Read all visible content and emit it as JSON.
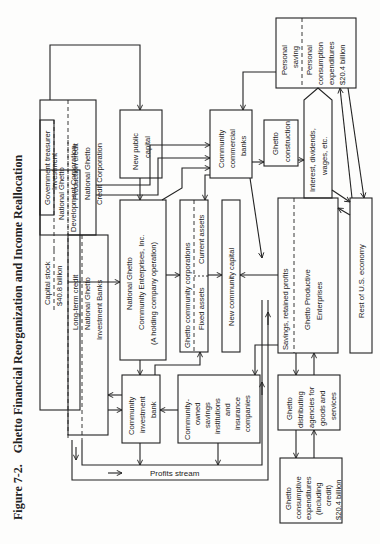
{
  "figure": {
    "number": "Figure 7-2.",
    "title": "Ghetto Financial Reorganization and Income Reallocation"
  },
  "nodes": {
    "gov_treasurer": "Government treasurer",
    "ngdc": [
      "National Ghetto",
      "Development Corporation"
    ],
    "capital_stock": [
      "Capital stock",
      "$40.8 billion"
    ],
    "investment": "Investment",
    "production_credit": "Production credit",
    "ngcc": [
      "National Ghetto",
      "Credit Corporation"
    ],
    "long_term_credit": "Long-term credit",
    "ngib": [
      "National Ghetto",
      "Investment Banks"
    ],
    "new_public_capital": [
      "New public",
      "capital"
    ],
    "ngce": [
      "National Ghetto",
      "Community Enterprises, Inc.",
      "(A holding company operation)"
    ],
    "community_investment_bank": [
      "Community",
      "investment",
      "bank"
    ],
    "community_savings": [
      "Community-",
      "owned",
      "savings",
      "institutions",
      "and",
      "insurance",
      "companies"
    ],
    "ghetto_community_corps": "Ghetto community corporations",
    "fixed_assets": "Fixed assets",
    "current_assets": "Current assets",
    "new_community_capital": "New community capital",
    "community_commercial_banks": [
      "Community",
      "commercial",
      "banks"
    ],
    "ghetto_construction": [
      "Ghetto",
      "construction"
    ],
    "savings_retained_profits": "Savings, retained profits",
    "ghetto_productive": [
      "Ghetto Productive",
      "Enterprises"
    ],
    "ghetto_distributing": [
      "Ghetto",
      "distributing",
      "agencies for",
      "goods and",
      "services"
    ],
    "ghetto_consumptive": [
      "Ghetto",
      "consumptive",
      "expenditures",
      "(including",
      "credit)",
      "$20.4 billion"
    ],
    "interest_dividends": [
      "Interest, dividends,",
      "wages, etc."
    ],
    "personal_saving": [
      "Personal",
      "saving"
    ],
    "personal_consumption": [
      "Personal",
      "consumption",
      "expenditures",
      "$20.4 billion"
    ],
    "rest_of_economy": "Rest of U.S. economy",
    "profits_stream": "Profits stream"
  }
}
